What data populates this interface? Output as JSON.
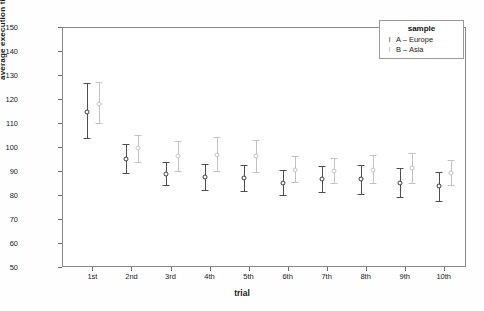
{
  "chart_data": {
    "type": "scatter",
    "title": "",
    "xlabel": "trial",
    "ylabel": "average execution time [sec]",
    "categories": [
      "1st",
      "2nd",
      "3rd",
      "4th",
      "5th",
      "6th",
      "7th",
      "8th",
      "9th",
      "10th"
    ],
    "ylim": [
      50,
      150
    ],
    "yticks": [
      50,
      60,
      70,
      80,
      90,
      100,
      110,
      120,
      130,
      140,
      150
    ],
    "grid": false,
    "legend": {
      "title": "sample",
      "position": "top-right",
      "entries": [
        {
          "label": "A – Europe",
          "key": "I",
          "color": "#4d4d4d"
        },
        {
          "label": "B – Asia",
          "key": "I",
          "color": "#c2c2c2"
        }
      ]
    },
    "series": [
      {
        "name": "A – Europe",
        "color": "#4d4d4d",
        "values": [
          115.0,
          95.5,
          89.0,
          88.0,
          87.5,
          85.5,
          87.0,
          87.0,
          85.5,
          84.0
        ],
        "err_low": [
          104.0,
          89.5,
          84.5,
          82.5,
          82.0,
          80.5,
          81.5,
          81.0,
          79.5,
          78.0
        ],
        "err_high": [
          127.0,
          101.5,
          94.0,
          93.5,
          93.0,
          91.0,
          92.5,
          93.0,
          91.5,
          90.0
        ]
      },
      {
        "name": "B – Asia",
        "color": "#c2c2c2",
        "values": [
          118.5,
          100.0,
          96.5,
          97.0,
          96.5,
          91.0,
          90.5,
          91.0,
          91.5,
          89.5
        ],
        "err_low": [
          110.5,
          94.0,
          90.5,
          90.5,
          90.0,
          86.0,
          85.5,
          85.5,
          85.5,
          84.5
        ],
        "err_high": [
          127.5,
          105.5,
          103.0,
          104.5,
          103.5,
          96.5,
          96.0,
          97.0,
          98.0,
          95.0
        ]
      }
    ]
  }
}
